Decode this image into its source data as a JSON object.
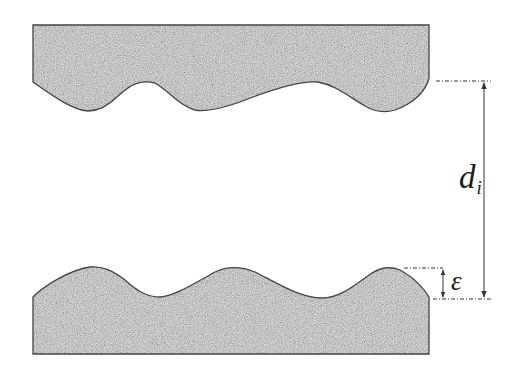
{
  "figure": {
    "labels": {
      "distance_symbol": "d",
      "distance_subscript": "i",
      "roughness_symbol": "ε"
    },
    "colors": {
      "surface_fill": "#9a9a9a",
      "surface_outline": "#444444",
      "annotation_line": "#333333",
      "background": "#ffffff"
    },
    "elements": {
      "top_surface": "upper rough wall (wavy bottom edge)",
      "bottom_surface": "lower rough wall (wavy top edge)",
      "distance_arrow": "vertical double reference arrow d_i",
      "roughness_arrow": "double-headed arrow epsilon"
    }
  }
}
